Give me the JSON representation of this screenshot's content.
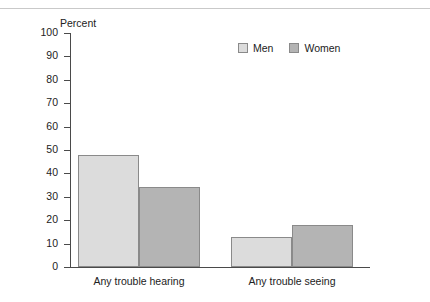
{
  "page": {
    "clipped_caption_text": "",
    "divider": "top-rule"
  },
  "colors": {
    "men": "#dcdcdc",
    "women": "#b4b4b4",
    "bar_border": "#8a8a8a",
    "axis": "#4a4a4a",
    "text": "#222222",
    "background": "#ffffff"
  },
  "legend": {
    "position": "top-right",
    "entries": [
      {
        "label": "Men",
        "color": "#dcdcdc"
      },
      {
        "label": "Women",
        "color": "#b4b4b4"
      }
    ]
  },
  "chart_data": {
    "type": "bar",
    "title": "",
    "subtitle": "",
    "xlabel": "",
    "ylabel": "Percent",
    "ylim": [
      0,
      100
    ],
    "yticks": [
      100,
      90,
      80,
      70,
      60,
      50,
      40,
      30,
      20,
      10,
      0
    ],
    "ytick_labels": [
      "100",
      "90",
      "80",
      "70",
      "60",
      "50",
      "40",
      "30",
      "20",
      "10",
      "0"
    ],
    "grid": false,
    "legend_position": "top-right",
    "categories": [
      "Any trouble hearing",
      "Any trouble seeing"
    ],
    "series": [
      {
        "name": "Men",
        "color": "#dcdcdc",
        "values": [
          48,
          13
        ]
      },
      {
        "name": "Women",
        "color": "#b4b4b4",
        "values": [
          34,
          18
        ]
      }
    ],
    "annotations": []
  }
}
